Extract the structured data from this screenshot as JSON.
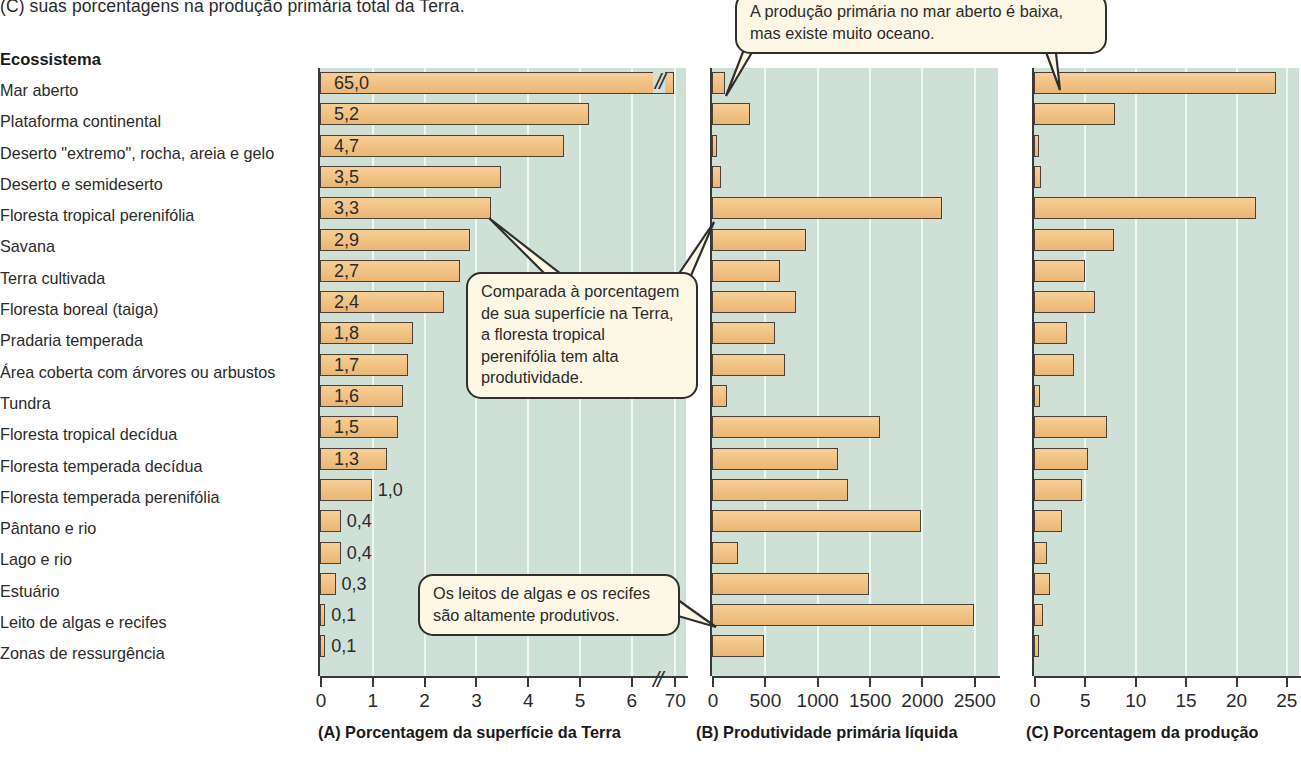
{
  "figure": {
    "top_caption": "(C) suas porcentagens na produção primária total da Terra.",
    "ecosystem_header": "Ecossistema"
  },
  "callouts": [
    {
      "id": "open-ocean",
      "text": "A produção primária no mar aberto é baixa, mas existe muito oceano."
    },
    {
      "id": "tropical-rainforest",
      "text": "Comparada à porcentagem de sua superfície na Terra, a floresta tropical perenifólia tem alta produtividade."
    },
    {
      "id": "algae-reefs",
      "text": "Os leitos de algas e os recifes são altamente produtivos."
    }
  ],
  "colors": {
    "plot_background": "#cfe0d7",
    "bar_fill": "#f1c183",
    "bar_stroke": "#4a4038",
    "gridline": "#f3f8f5",
    "callout_fill": "#fdf8e6",
    "axis": "#3a3a3a"
  },
  "chart_data": {
    "type": "bar",
    "orientation": "horizontal",
    "title": "(C) suas porcentagens na produção primária total da Terra.",
    "categories": [
      "Mar aberto",
      "Plataforma continental",
      "Deserto \"extremo\", rocha, areia e gelo",
      "Deserto e semideserto",
      "Floresta tropical perenifólia",
      "Savana",
      "Terra cultivada",
      "Floresta boreal (taiga)",
      "Pradaria temperada",
      "Área coberta com árvores ou arbustos",
      "Tundra",
      "Floresta tropical decídua",
      "Floresta temperada decídua",
      "Floresta temperada perenifólia",
      "Pântano e rio",
      "Lago e rio",
      "Estuário",
      "Leito de algas e recifes",
      "Zonas de ressurgência"
    ],
    "panels": [
      {
        "id": "A",
        "caption": "(A) Porcentagem da superfície da Terra",
        "xlabel": "Porcentagem da superfície da Terra",
        "ticks": [
          "0",
          "1",
          "2",
          "3",
          "4",
          "5",
          "6",
          "70"
        ],
        "axis_break": true,
        "axis_break_after": "6",
        "xlim": [
          0,
          6
        ],
        "grid": true,
        "value_labels": [
          "65,0",
          "5,2",
          "4,7",
          "3,5",
          "3,3",
          "2,9",
          "2,7",
          "2,4",
          "1,8",
          "1,7",
          "1,6",
          "1,5",
          "1,3",
          "1,0",
          "0,4",
          "0,4",
          "0,3",
          "0,1",
          "0,1"
        ],
        "values": [
          65.0,
          5.2,
          4.7,
          3.5,
          3.3,
          2.9,
          2.7,
          2.4,
          1.8,
          1.7,
          1.6,
          1.5,
          1.3,
          1.0,
          0.4,
          0.4,
          0.3,
          0.1,
          0.1
        ]
      },
      {
        "id": "B",
        "caption": "(B) Produtividade primária líquida",
        "xlabel": "Produtividade primária líquida",
        "ticks": [
          "0",
          "500",
          "1000",
          "1500",
          "2000",
          "2500"
        ],
        "axis_break": false,
        "xlim": [
          0,
          2750
        ],
        "grid": true,
        "values": [
          125,
          360,
          3,
          90,
          2200,
          900,
          650,
          800,
          600,
          700,
          140,
          1600,
          1200,
          1300,
          2000,
          250,
          1500,
          2500,
          500
        ]
      },
      {
        "id": "C",
        "caption": "(C) Porcentagem da produção",
        "xlabel": "Porcentagem da produção",
        "ticks": [
          "0",
          "5",
          "10",
          "15",
          "20",
          "25"
        ],
        "axis_break": false,
        "xlim": [
          0,
          26.5
        ],
        "grid": true,
        "values": [
          24.0,
          8.0,
          0.05,
          0.7,
          22.0,
          7.9,
          5.1,
          6.1,
          3.3,
          4.0,
          0.6,
          7.2,
          5.4,
          4.8,
          2.8,
          1.3,
          1.6,
          0.9,
          0.4
        ]
      }
    ]
  }
}
